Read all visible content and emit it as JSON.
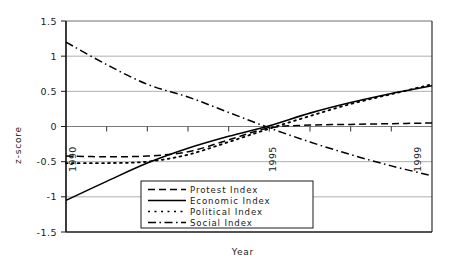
{
  "chart_data": {
    "type": "line",
    "title": "",
    "xlabel": "Year",
    "ylabel": "z-score",
    "xlim": [
      1990,
      1999
    ],
    "ylim": [
      -1.5,
      1.5
    ],
    "grid": true,
    "legend_position": "bottom-center",
    "x": [
      1990,
      1991,
      1992,
      1993,
      1994,
      1995,
      1996,
      1997,
      1998,
      1999
    ],
    "xtick_labels": [
      "1990",
      "1995",
      "1999"
    ],
    "xtick_values": [
      1990,
      1995,
      1999
    ],
    "ytick_labels": [
      "1.5",
      "1",
      "0.5",
      "0",
      "-0.5",
      "-1",
      "-1.5"
    ],
    "ytick_values": [
      1.5,
      1,
      0.5,
      0,
      -0.5,
      -1,
      -1.5
    ],
    "series": [
      {
        "name": "Protest Index",
        "style": "dashed",
        "color": "#000000",
        "values": [
          -0.42,
          -0.43,
          -0.42,
          -0.36,
          -0.19,
          -0.02,
          0.02,
          0.03,
          0.04,
          0.05
        ]
      },
      {
        "name": "Economic Index",
        "style": "solid",
        "color": "#000000",
        "values": [
          -1.05,
          -0.78,
          -0.52,
          -0.31,
          -0.14,
          0.01,
          0.19,
          0.34,
          0.47,
          0.58
        ]
      },
      {
        "name": "Political Index",
        "style": "dotted",
        "color": "#000000",
        "values": [
          -0.52,
          -0.52,
          -0.5,
          -0.4,
          -0.22,
          -0.03,
          0.15,
          0.32,
          0.46,
          0.6
        ]
      },
      {
        "name": "Social Index",
        "style": "dashdot",
        "color": "#000000",
        "values": [
          1.2,
          0.88,
          0.6,
          0.42,
          0.2,
          -0.02,
          -0.22,
          -0.4,
          -0.56,
          -0.7
        ]
      }
    ]
  },
  "axes": {
    "y_label": "z-score",
    "x_label": "Year"
  },
  "legend": {
    "items": [
      {
        "label": "Protest Index",
        "style": "dashed"
      },
      {
        "label": "Economic Index",
        "style": "solid"
      },
      {
        "label": "Political Index",
        "style": "dotted"
      },
      {
        "label": "Social Index",
        "style": "dashdot"
      }
    ]
  },
  "y_ticks": [
    {
      "label": "1.5"
    },
    {
      "label": "1"
    },
    {
      "label": "0.5"
    },
    {
      "label": "0"
    },
    {
      "label": "-0.5"
    },
    {
      "label": "-1"
    },
    {
      "label": "-1.5"
    }
  ],
  "x_ticks": [
    {
      "label": "1990"
    },
    {
      "label": "1995"
    },
    {
      "label": "1999"
    }
  ]
}
